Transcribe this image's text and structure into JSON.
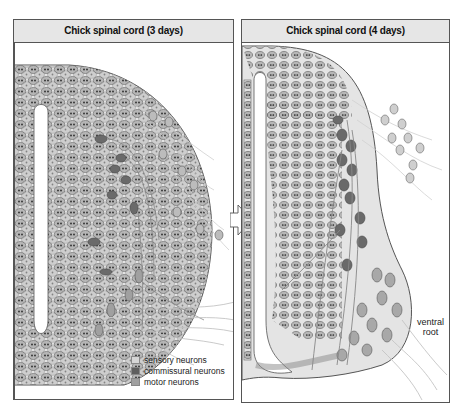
{
  "panels": [
    {
      "title": "Chick spinal cord (3 days)"
    },
    {
      "title": "Chick spinal cord (4 days)"
    }
  ],
  "legend": {
    "items": [
      {
        "label": "sensory neurons",
        "color": "#d6d6d6"
      },
      {
        "label": "commissural neurons",
        "color": "#5e5e5e"
      },
      {
        "label": "motor neurons",
        "color": "#a0a0a0"
      }
    ]
  },
  "annotations": {
    "ventral_root_line1": "ventral",
    "ventral_root_line2": "root"
  },
  "colors": {
    "tissue": "#e4e4e4",
    "cell": "#b4b4b4",
    "commissural": "#6a6a6a",
    "motor": "#a8a8a8",
    "axon": "#bdbdbd",
    "outline": "#555555"
  }
}
